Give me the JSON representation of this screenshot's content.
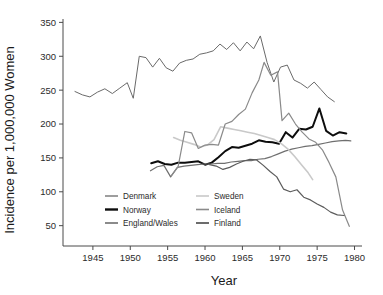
{
  "chart_data": {
    "type": "line",
    "title": "",
    "xlabel": "Year",
    "ylabel": "Incidence per 1,000,000 Women",
    "xlim": [
      1941,
      1981
    ],
    "ylim": [
      20,
      355
    ],
    "grid": false,
    "legend_position": "inside-bottom-left",
    "xticks": [
      "1945",
      "1950",
      "1955",
      "1960",
      "1965",
      "1970",
      "1975",
      "1980"
    ],
    "xtick_values": [
      1945,
      1950,
      1955,
      1960,
      1965,
      1970,
      1975,
      1980
    ],
    "yticks": [
      "50",
      "100",
      "150",
      "200",
      "250",
      "300",
      "350"
    ],
    "ytick_values": [
      50,
      100,
      150,
      200,
      250,
      300,
      350
    ],
    "series": [
      {
        "name": "Denmark",
        "color": "#6a6a6a",
        "width": 1.0,
        "x": [
          1942.6,
          1943.6,
          1944.6,
          1945.6,
          1946.6,
          1947.6,
          1948.6,
          1949.6,
          1950.4,
          1951.2,
          1952.1,
          1953.0,
          1953.9,
          1954.8,
          1955.7,
          1956.6,
          1957.5,
          1958.4,
          1959.3,
          1960.2,
          1961.1,
          1962.0,
          1962.9,
          1963.8,
          1964.7,
          1965.6,
          1966.5,
          1967.4,
          1968.3,
          1969.2,
          1970.1,
          1971.0,
          1971.9,
          1972.8,
          1973.7,
          1974.6,
          1975.5,
          1976.4,
          1977.3
        ],
        "y": [
          248,
          243,
          240,
          247,
          252,
          245,
          253,
          261,
          238,
          300,
          298,
          284,
          297,
          283,
          278,
          290,
          294,
          296,
          303,
          305,
          308,
          318,
          310,
          320,
          308,
          321,
          311,
          330,
          291,
          262,
          284,
          287,
          265,
          260,
          253,
          262,
          251,
          240,
          233
        ]
      },
      {
        "name": "Norway",
        "color": "#0d0d0d",
        "width": 2.0,
        "x": [
          1952.8,
          1953.7,
          1954.6,
          1955.5,
          1956.4,
          1957.3,
          1958.2,
          1959.1,
          1960.0,
          1960.9,
          1961.8,
          1962.7,
          1963.6,
          1964.5,
          1965.4,
          1966.3,
          1967.2,
          1968.1,
          1969.0,
          1969.9,
          1970.8,
          1971.7,
          1972.6,
          1973.5,
          1974.4,
          1975.3,
          1976.2,
          1977.1,
          1978.0,
          1978.9
        ],
        "y": [
          142,
          145,
          141,
          140,
          143,
          143,
          144,
          145,
          140,
          143,
          151,
          160,
          166,
          165,
          168,
          171,
          176,
          174,
          173,
          171,
          188,
          180,
          193,
          192,
          196,
          223,
          190,
          183,
          188,
          186
        ]
      },
      {
        "name": "England/Wales",
        "color": "#6f6f6f",
        "width": 1.2,
        "x": [
          1952.7,
          1953.6,
          1954.5,
          1955.4,
          1956.3,
          1957.2,
          1958.1,
          1959.0,
          1959.9,
          1960.8,
          1961.7,
          1962.6,
          1963.5,
          1964.4,
          1965.3,
          1966.2,
          1967.1,
          1968.0,
          1968.9,
          1969.8,
          1970.7,
          1971.6,
          1972.5,
          1973.4,
          1974.3,
          1975.2,
          1976.1,
          1977.0,
          1977.9,
          1978.8,
          1979.5
        ],
        "y": [
          131,
          137,
          139,
          122,
          136,
          138,
          139,
          140,
          141,
          141,
          142,
          142,
          144,
          145,
          146,
          146,
          148,
          149,
          152,
          156,
          160,
          163,
          165,
          167,
          168,
          170,
          172,
          174,
          175,
          176,
          175
        ]
      },
      {
        "name": "Sweden",
        "color": "#c9c9c9",
        "width": 1.6,
        "x": [
          1955.8,
          1956.7,
          1957.6,
          1958.5,
          1959.4,
          1960.3,
          1961.2,
          1962.1,
          1963.0,
          1963.9,
          1964.8,
          1965.7,
          1966.6,
          1967.5,
          1968.4,
          1969.3,
          1970.2,
          1971.1,
          1972.0,
          1972.9,
          1973.8,
          1974.4
        ],
        "y": [
          180,
          176,
          173,
          170,
          166,
          169,
          177,
          196,
          194,
          192,
          190,
          188,
          186,
          183,
          180,
          177,
          171,
          163,
          152,
          140,
          128,
          118
        ]
      },
      {
        "name": "Iceland",
        "color": "#8a8a8a",
        "width": 1.2,
        "x": [
          1955.5,
          1956.4,
          1957.3,
          1958.2,
          1959.1,
          1960.0,
          1960.9,
          1961.8,
          1962.7,
          1963.6,
          1964.5,
          1965.4,
          1966.3,
          1967.2,
          1967.9,
          1968.8,
          1969.7,
          1970.3,
          1971.2,
          1972.1,
          1973.0,
          1973.9,
          1974.8,
          1975.7,
          1976.6,
          1977.5,
          1978.4,
          1979.3
        ],
        "y": [
          124,
          137,
          189,
          187,
          164,
          169,
          170,
          169,
          200,
          204,
          214,
          222,
          246,
          265,
          291,
          272,
          277,
          205,
          216,
          200,
          188,
          178,
          173,
          162,
          143,
          122,
          73,
          49
        ]
      },
      {
        "name": "Finland",
        "color": "#5c5c5c",
        "width": 1.2,
        "x": [
          1960.6,
          1961.5,
          1962.4,
          1963.3,
          1964.2,
          1965.1,
          1966.0,
          1966.9,
          1967.8,
          1968.7,
          1969.6,
          1970.5,
          1971.4,
          1972.3,
          1973.2,
          1974.1,
          1975.0,
          1975.9,
          1976.8,
          1977.7,
          1978.6
        ],
        "y": [
          140,
          138,
          133,
          136,
          141,
          145,
          148,
          147,
          139,
          130,
          122,
          104,
          100,
          103,
          92,
          88,
          82,
          77,
          70,
          66,
          65
        ]
      }
    ],
    "legend": [
      {
        "label": "Denmark",
        "color": "#6a6a6a",
        "width": 1.3,
        "col": 0,
        "row": 0
      },
      {
        "label": "Norway",
        "color": "#0d0d0d",
        "width": 2.4,
        "col": 0,
        "row": 1
      },
      {
        "label": "England/Wales",
        "color": "#6f6f6f",
        "width": 1.6,
        "col": 0,
        "row": 2
      },
      {
        "label": "Sweden",
        "color": "#c9c9c9",
        "width": 1.6,
        "col": 1,
        "row": 0
      },
      {
        "label": "Iceland",
        "color": "#8a8a8a",
        "width": 1.6,
        "col": 1,
        "row": 1
      },
      {
        "label": "Finland",
        "color": "#5c5c5c",
        "width": 1.8,
        "col": 1,
        "row": 2
      }
    ]
  }
}
